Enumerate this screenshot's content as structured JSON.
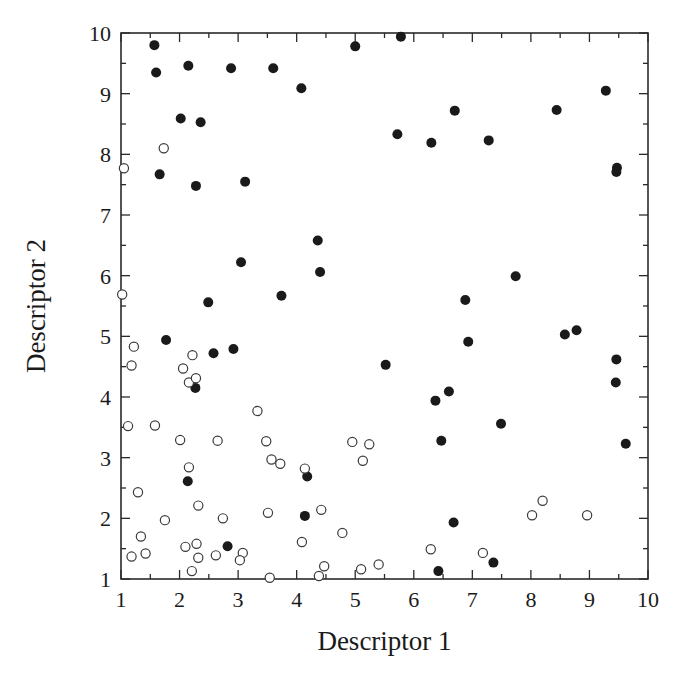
{
  "chart_data": {
    "type": "scatter",
    "title": "",
    "xlabel": "Descriptor 1",
    "ylabel": "Descriptor 2",
    "xlim": [
      1,
      10
    ],
    "ylim": [
      1,
      10
    ],
    "xticks": [
      "1",
      "2",
      "3",
      "4",
      "5",
      "6",
      "7",
      "8",
      "9",
      "10"
    ],
    "yticks": [
      "1",
      "2",
      "3",
      "4",
      "5",
      "6",
      "7",
      "8",
      "9",
      "10"
    ],
    "grid": false,
    "legend": null,
    "colors": {
      "filled": "#1a1a1a",
      "open_stroke": "#3a3a3a",
      "axis": "#2a2a2a"
    },
    "series": [
      {
        "name": "filled",
        "marker": "filled-circle",
        "points": [
          [
            1.57,
            9.8
          ],
          [
            1.6,
            9.35
          ],
          [
            2.15,
            9.46
          ],
          [
            2.88,
            9.42
          ],
          [
            3.6,
            9.42
          ],
          [
            5.0,
            9.78
          ],
          [
            5.78,
            9.94
          ],
          [
            4.08,
            9.09
          ],
          [
            9.28,
            9.05
          ],
          [
            2.02,
            8.59
          ],
          [
            2.36,
            8.53
          ],
          [
            5.72,
            8.33
          ],
          [
            6.3,
            8.19
          ],
          [
            6.7,
            8.72
          ],
          [
            7.28,
            8.23
          ],
          [
            8.44,
            8.73
          ],
          [
            9.47,
            7.78
          ],
          [
            9.46,
            7.71
          ],
          [
            1.66,
            7.67
          ],
          [
            2.28,
            7.48
          ],
          [
            3.12,
            7.55
          ],
          [
            4.36,
            6.58
          ],
          [
            4.4,
            6.06
          ],
          [
            3.05,
            6.22
          ],
          [
            3.74,
            5.67
          ],
          [
            7.74,
            5.99
          ],
          [
            2.49,
            5.56
          ],
          [
            6.88,
            5.6
          ],
          [
            1.77,
            4.94
          ],
          [
            2.58,
            4.72
          ],
          [
            2.92,
            4.79
          ],
          [
            5.52,
            4.53
          ],
          [
            6.93,
            4.91
          ],
          [
            8.58,
            5.03
          ],
          [
            8.78,
            5.1
          ],
          [
            9.46,
            4.62
          ],
          [
            9.45,
            4.24
          ],
          [
            2.27,
            4.15
          ],
          [
            6.37,
            3.94
          ],
          [
            6.6,
            4.09
          ],
          [
            7.49,
            3.56
          ],
          [
            6.47,
            3.28
          ],
          [
            9.62,
            3.23
          ],
          [
            2.14,
            2.61
          ],
          [
            4.18,
            2.69
          ],
          [
            4.14,
            2.04
          ],
          [
            6.68,
            1.93
          ],
          [
            2.82,
            1.54
          ],
          [
            6.42,
            1.13
          ],
          [
            7.36,
            1.27
          ]
        ]
      },
      {
        "name": "open",
        "marker": "open-circle",
        "points": [
          [
            1.73,
            8.1
          ],
          [
            1.05,
            7.77
          ],
          [
            1.02,
            5.69
          ],
          [
            1.22,
            4.83
          ],
          [
            1.18,
            4.52
          ],
          [
            2.22,
            4.69
          ],
          [
            2.06,
            4.47
          ],
          [
            2.16,
            4.24
          ],
          [
            2.28,
            4.31
          ],
          [
            1.12,
            3.52
          ],
          [
            1.58,
            3.53
          ],
          [
            3.33,
            3.77
          ],
          [
            2.01,
            3.29
          ],
          [
            2.65,
            3.28
          ],
          [
            3.48,
            3.27
          ],
          [
            3.57,
            2.97
          ],
          [
            3.72,
            2.9
          ],
          [
            2.16,
            2.84
          ],
          [
            4.14,
            2.82
          ],
          [
            4.95,
            3.26
          ],
          [
            5.24,
            3.22
          ],
          [
            5.13,
            2.95
          ],
          [
            1.29,
            2.43
          ],
          [
            2.32,
            2.21
          ],
          [
            3.51,
            2.09
          ],
          [
            4.42,
            2.14
          ],
          [
            1.75,
            1.97
          ],
          [
            2.74,
            2.0
          ],
          [
            8.02,
            2.05
          ],
          [
            8.2,
            2.29
          ],
          [
            8.96,
            2.05
          ],
          [
            1.34,
            1.7
          ],
          [
            4.78,
            1.76
          ],
          [
            4.09,
            1.61
          ],
          [
            2.1,
            1.53
          ],
          [
            2.29,
            1.58
          ],
          [
            6.29,
            1.49
          ],
          [
            7.18,
            1.43
          ],
          [
            1.18,
            1.37
          ],
          [
            1.42,
            1.42
          ],
          [
            2.32,
            1.35
          ],
          [
            2.62,
            1.39
          ],
          [
            3.08,
            1.43
          ],
          [
            3.03,
            1.31
          ],
          [
            2.21,
            1.13
          ],
          [
            3.54,
            1.02
          ],
          [
            4.38,
            1.05
          ],
          [
            4.47,
            1.21
          ],
          [
            5.1,
            1.16
          ],
          [
            5.4,
            1.24
          ]
        ]
      }
    ]
  },
  "axes": {
    "x_title": "Descriptor 1",
    "y_title": "Descriptor 2"
  }
}
